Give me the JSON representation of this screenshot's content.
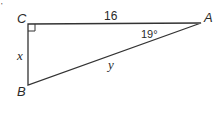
{
  "diagram": {
    "type": "right-triangle",
    "vertices": {
      "A": {
        "label": "A",
        "x": 201,
        "y": 23
      },
      "B": {
        "label": "B",
        "x": 28,
        "y": 85
      },
      "C": {
        "label": "C",
        "x": 28,
        "y": 24
      }
    },
    "sides": {
      "CA": {
        "label": "16"
      },
      "CB": {
        "label": "x"
      },
      "AB": {
        "label": "y"
      }
    },
    "angle_A": {
      "label": "19°"
    },
    "right_angle_at": "C",
    "stroke_color": "#333333",
    "corner_mark": "'"
  }
}
